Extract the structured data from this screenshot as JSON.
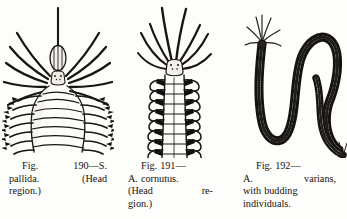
{
  "page": {
    "background_color": "#fdfdfb",
    "ink_color": "#15120f",
    "width": 347,
    "height": 219
  },
  "figures": [
    {
      "id": "fig-190",
      "subject": "polychaete-worm-head-region",
      "species": "S. pallida",
      "number": "190",
      "caption": {
        "line1_left": "Fig.",
        "line1_right": "190—S.",
        "line2_left": "pallida.",
        "line2_right": "(Head",
        "line3": "region.)",
        "full_text": "Fig. 190—S. pallida. (Head region.)"
      }
    },
    {
      "id": "fig-191",
      "subject": "polychaete-worm-head-region",
      "species": "A. cornutus",
      "number": "191",
      "caption": {
        "line1": "Fig. 191—",
        "line2": "A. cornutus.",
        "line3_left": "(Head",
        "line3_right": "re-",
        "line4": "gion.)",
        "full_text": "Fig. 191—A. cornutus. (Head region.)"
      }
    },
    {
      "id": "fig-192",
      "subject": "polychaete-worm-with-budding-individuals",
      "species": "A. varians",
      "number": "192",
      "caption": {
        "line1": "Fig. 192—",
        "line2_left": "A.",
        "line2_right": "varians,",
        "line3": "with budding",
        "line4": "individuals.",
        "full_text": "Fig. 192—A. varians, with budding individuals."
      }
    }
  ]
}
